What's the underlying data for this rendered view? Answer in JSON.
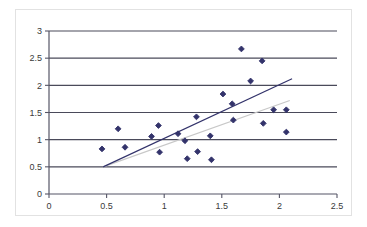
{
  "chart_data": {
    "type": "scatter",
    "title": "",
    "xlabel": "",
    "ylabel": "",
    "xlim": [
      0,
      2.5
    ],
    "ylim": [
      0,
      3
    ],
    "xticks": [
      0,
      0.5,
      1,
      1.5,
      2,
      2.5
    ],
    "yticks": [
      0,
      0.5,
      1,
      1.5,
      2,
      2.5,
      3
    ],
    "xtick_labels": [
      "0",
      "0.5",
      "1",
      "1.5",
      "2",
      "2.5"
    ],
    "ytick_labels": [
      "0",
      "0.5",
      "1",
      "1.5",
      "2",
      "2.5",
      "3"
    ],
    "grid": "horizontal",
    "legend": "none",
    "marker": "diamond",
    "marker_color": "#33336b",
    "series": [
      {
        "name": "observations",
        "points": [
          [
            0.46,
            0.83
          ],
          [
            0.6,
            1.2
          ],
          [
            0.66,
            0.86
          ],
          [
            0.89,
            1.06
          ],
          [
            0.95,
            1.26
          ],
          [
            0.96,
            0.77
          ],
          [
            1.12,
            1.11
          ],
          [
            1.18,
            0.98
          ],
          [
            1.2,
            0.65
          ],
          [
            1.28,
            1.42
          ],
          [
            1.29,
            0.78
          ],
          [
            1.4,
            1.07
          ],
          [
            1.41,
            0.63
          ],
          [
            1.51,
            1.84
          ],
          [
            1.59,
            1.66
          ],
          [
            1.6,
            1.36
          ],
          [
            1.67,
            2.67
          ],
          [
            1.75,
            2.08
          ],
          [
            1.85,
            2.45
          ],
          [
            1.86,
            1.3
          ],
          [
            1.95,
            1.55
          ],
          [
            2.06,
            1.55
          ],
          [
            2.06,
            1.14
          ]
        ]
      }
    ],
    "trendlines": [
      {
        "name": "regression-line-dark",
        "color": "#33336b",
        "from": [
          0.47,
          0.5
        ],
        "to": [
          2.11,
          2.12
        ]
      },
      {
        "name": "regression-line-light",
        "color": "#c8c8c8",
        "from": [
          0.47,
          0.5
        ],
        "to": [
          2.09,
          1.72
        ]
      }
    ],
    "axis_color": "#555566",
    "gridline_color": "#4a4a5a",
    "background": "#ffffff"
  }
}
